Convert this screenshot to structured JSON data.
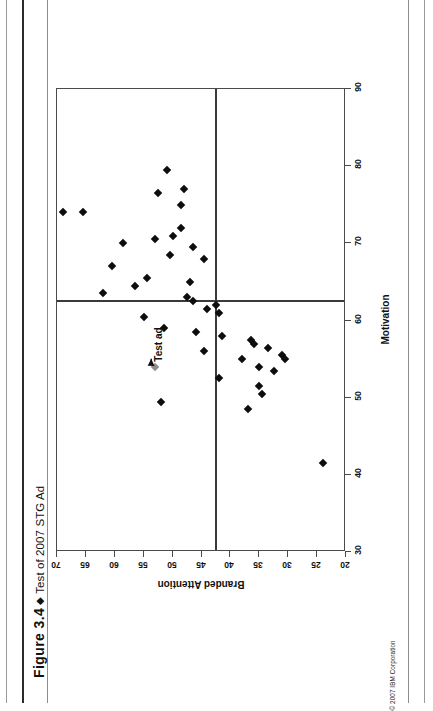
{
  "page": {
    "figure_label": "Figure 3.4",
    "figure_diamond": "◆",
    "figure_title": "Test of 2007 STG Ad",
    "copyright": "© 2007 IBM Corporation"
  },
  "chart_data": {
    "type": "scatter",
    "title": "Test of 2007 STG Ad",
    "xlabel": "Motivation",
    "ylabel": "Branded Attention",
    "xlim": [
      30,
      90
    ],
    "ylim": [
      20,
      70
    ],
    "y_axis_inverted": true,
    "xticks": [
      30,
      40,
      50,
      60,
      70,
      80,
      90
    ],
    "yticks": [
      70,
      65,
      60,
      55,
      50,
      45,
      40,
      35,
      30,
      25,
      20
    ],
    "grid": false,
    "legend": "none",
    "reference_lines": {
      "x": 62.5,
      "y": 42.5
    },
    "annotations": [
      {
        "text": "Test ad",
        "x": 56.5,
        "y": 52.5
      }
    ],
    "series": [
      {
        "name": "Ads",
        "marker": "diamond",
        "color": "#0d0d0d",
        "points": [
          [
            79.5,
            51.0
          ],
          [
            77.0,
            48.0
          ],
          [
            76.5,
            52.5
          ],
          [
            75.0,
            48.5
          ],
          [
            74.0,
            69.0
          ],
          [
            74.0,
            65.5
          ],
          [
            72.0,
            48.5
          ],
          [
            71.0,
            50.0
          ],
          [
            70.5,
            53.0
          ],
          [
            70.0,
            58.5
          ],
          [
            69.5,
            46.5
          ],
          [
            68.5,
            50.5
          ],
          [
            68.0,
            44.5
          ],
          [
            67.0,
            60.5
          ],
          [
            65.5,
            54.5
          ],
          [
            65.0,
            47.0
          ],
          [
            64.5,
            56.5
          ],
          [
            63.5,
            62.0
          ],
          [
            63.0,
            47.5
          ],
          [
            62.5,
            46.5
          ],
          [
            62.0,
            42.5
          ],
          [
            61.5,
            44.0
          ],
          [
            61.0,
            42.0
          ],
          [
            60.5,
            55.0
          ],
          [
            59.0,
            51.5
          ],
          [
            58.5,
            46.0
          ],
          [
            58.0,
            41.5
          ],
          [
            57.5,
            36.5
          ],
          [
            57.0,
            36.0
          ],
          [
            56.5,
            33.5
          ],
          [
            56.0,
            44.5
          ],
          [
            55.5,
            31.0
          ],
          [
            55.0,
            30.5
          ],
          [
            55.0,
            38.0
          ],
          [
            54.0,
            35.0
          ],
          [
            53.5,
            32.5
          ],
          [
            52.5,
            42.0
          ],
          [
            51.5,
            35.0
          ],
          [
            50.5,
            34.5
          ],
          [
            49.5,
            52.0
          ],
          [
            48.5,
            37.0
          ],
          [
            41.5,
            24.0
          ]
        ]
      },
      {
        "name": "Test ad",
        "marker": "diamond",
        "color": "#8e8e8e",
        "points": [
          [
            54.0,
            53.0
          ]
        ]
      }
    ]
  }
}
